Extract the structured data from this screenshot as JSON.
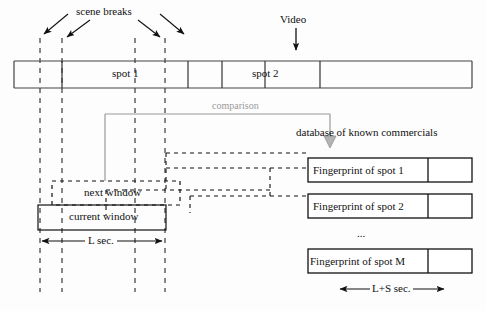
{
  "diagram": {
    "title_labels": {
      "scene_breaks": "scene breaks",
      "video": "Video",
      "comparison": "comparison",
      "database": "database of known commercials",
      "ellipsis": "..."
    },
    "video_bar": {
      "segments": [
        {
          "label": ""
        },
        {
          "label": "spot 1"
        },
        {
          "label": ""
        },
        {
          "label": "spot 2"
        },
        {
          "label": ""
        }
      ],
      "spot1_label": "spot 1",
      "spot2_label": "spot 2"
    },
    "windows": {
      "current": "current window",
      "next": "next window"
    },
    "fingerprints": [
      {
        "label": "Fingerprint of spot 1"
      },
      {
        "label": "Fingerprint of spot 2"
      },
      {
        "label": "Fingerprint of spot M"
      }
    ],
    "measures": {
      "left": "L sec.",
      "right": "L+S sec."
    },
    "colors": {
      "ink": "#111111",
      "gray": "#9a9a9a",
      "background": "#fdfdfd"
    }
  }
}
